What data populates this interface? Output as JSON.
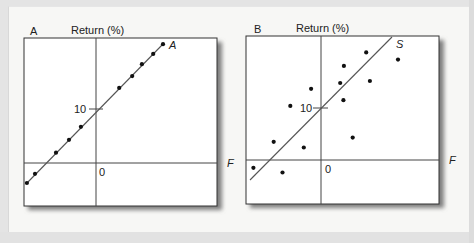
{
  "figure": {
    "panels": [
      {
        "id": "A",
        "panel_label": "A",
        "y_axis_label": "Return (%)",
        "x_axis_label": "F",
        "line_label": "A",
        "tick_label_10": "10",
        "origin_label": "0"
      },
      {
        "id": "B",
        "panel_label": "B",
        "y_axis_label": "Return (%)",
        "x_axis_label": "F",
        "line_label": "S",
        "tick_label_10": "10",
        "origin_label": "0"
      }
    ],
    "colors": {
      "background": "#f7f7f5",
      "plot_fill": "#ffffff",
      "line": "#555555",
      "dot": "#111111",
      "shadow": "#8a8a8a"
    }
  },
  "chart_data": [
    {
      "type": "scatter",
      "title": "A",
      "ylabel": "Return (%)",
      "xlabel": "F",
      "fit_line_label": "A",
      "y_ticks": [
        0,
        10
      ],
      "points_x": [
        -12.8,
        -11.3,
        -7.4,
        -5.0,
        -2.8,
        4.3,
        6.7,
        8.5,
        10.6,
        12.4
      ],
      "points_y": [
        -3.7,
        -2.0,
        1.9,
        4.3,
        6.7,
        13.9,
        16.1,
        18.3,
        20.2,
        22.0
      ],
      "fit_line": {
        "intercept": 10,
        "slope": 1.0
      }
    },
    {
      "type": "scatter",
      "title": "B",
      "ylabel": "Return (%)",
      "xlabel": "F",
      "fit_line_label": "S",
      "y_ticks": [
        0,
        10
      ],
      "points_x": [
        -13.0,
        -7.4,
        -9.1,
        -3.3,
        -5.9,
        -1.9,
        3.7,
        4.4,
        4.3,
        8.7,
        9.4,
        14.8,
        6.1
      ],
      "points_y": [
        -1.5,
        -2.4,
        3.5,
        2.4,
        10.4,
        13.7,
        14.8,
        18.1,
        11.5,
        20.7,
        15.2,
        19.3,
        4.3
      ],
      "fit_line": {
        "intercept": 10,
        "slope": 1.0
      }
    }
  ]
}
